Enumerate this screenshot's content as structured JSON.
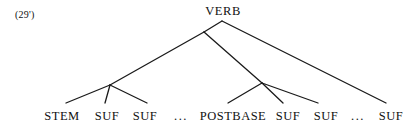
{
  "figure": {
    "example_number": "(29')",
    "root": {
      "label": "VERB"
    },
    "colors": {
      "background": "#ffffff",
      "ink": "#111111",
      "line": "#1a1a1a"
    },
    "leaves": [
      {
        "label": "STEM",
        "x": 62,
        "kind": "terminal"
      },
      {
        "label": "SUF",
        "x": 107,
        "kind": "terminal"
      },
      {
        "label": "SUF",
        "x": 145,
        "kind": "terminal"
      },
      {
        "label": "...",
        "x": 181,
        "kind": "ellipsis"
      },
      {
        "label": "POSTBASE",
        "x": 233,
        "kind": "terminal"
      },
      {
        "label": "SUF",
        "x": 288,
        "kind": "terminal"
      },
      {
        "label": "SUF",
        "x": 326,
        "kind": "terminal"
      },
      {
        "label": "...",
        "x": 358,
        "kind": "ellipsis"
      },
      {
        "label": "SUF",
        "x": 391,
        "kind": "terminal"
      }
    ],
    "nodes": {
      "root_apex": {
        "x": 222,
        "y": 21
      },
      "left_junction": {
        "x": 204,
        "y": 32
      },
      "left_node": {
        "x": 110,
        "y": 85
      },
      "right_node": {
        "x": 262,
        "y": 83
      },
      "right_far_end": {
        "x": 386,
        "y": 103
      }
    },
    "edges": [
      {
        "from": "root_apex",
        "to": "left_junction",
        "name": "root-to-left-junction"
      },
      {
        "from": "root_apex",
        "to": "right_far_end",
        "name": "root-to-final-suffix"
      },
      {
        "from": "left_junction",
        "to": "left_node",
        "name": "left-junction-to-stem-group"
      },
      {
        "from": "left_junction",
        "to": "right_node",
        "name": "left-junction-to-postbase-group"
      },
      {
        "from": "left_node",
        "to": "leaf_stem",
        "name": "branch-to-stem"
      },
      {
        "from": "left_node",
        "to": "leaf_suf1",
        "name": "branch-to-suf-1"
      },
      {
        "from": "left_node",
        "to": "leaf_suf2",
        "name": "branch-to-suf-2"
      },
      {
        "from": "right_node",
        "to": "leaf_postbase",
        "name": "branch-to-postbase"
      },
      {
        "from": "right_node",
        "to": "leaf_suf3",
        "name": "branch-to-suf-3"
      },
      {
        "from": "right_node",
        "to": "leaf_suf4",
        "name": "branch-to-suf-4"
      }
    ]
  }
}
